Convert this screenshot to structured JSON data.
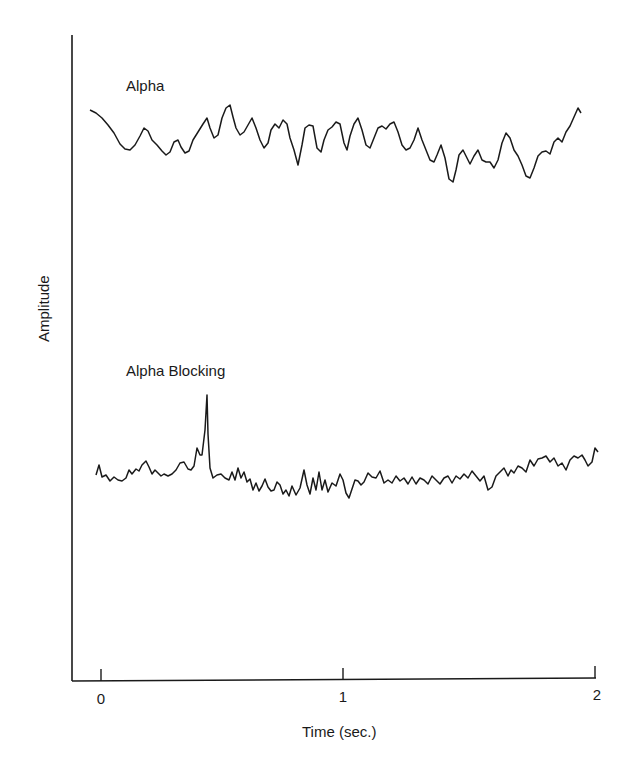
{
  "chart_data": {
    "type": "line",
    "title": "",
    "xlabel": "Time (sec.)",
    "ylabel": "Amplitude",
    "xlim": [
      -0.12,
      2.0
    ],
    "x_ticks": [
      0,
      1,
      2
    ],
    "x_tick_labels": [
      "0",
      "1",
      "2"
    ],
    "grid": false,
    "legend": "none (inline trace labels)",
    "series": [
      {
        "name": "Alpha",
        "description": "Regular rhythmic ~10 Hz alpha oscillation, moderate amplitude",
        "points_px": [
          [
            90,
            110
          ],
          [
            96,
            113
          ],
          [
            102,
            118
          ],
          [
            108,
            125
          ],
          [
            114,
            133
          ],
          [
            120,
            144
          ],
          [
            125,
            149
          ],
          [
            130,
            150
          ],
          [
            135,
            145
          ],
          [
            140,
            136
          ],
          [
            144,
            128
          ],
          [
            148,
            131
          ],
          [
            152,
            140
          ],
          [
            157,
            145
          ],
          [
            162,
            151
          ],
          [
            166,
            155
          ],
          [
            170,
            152
          ],
          [
            174,
            142
          ],
          [
            178,
            140
          ],
          [
            181,
            147
          ],
          [
            185,
            153
          ],
          [
            189,
            151
          ],
          [
            193,
            140
          ],
          [
            198,
            132
          ],
          [
            203,
            124
          ],
          [
            207,
            118
          ],
          [
            210,
            128
          ],
          [
            214,
            138
          ],
          [
            218,
            135
          ],
          [
            222,
            118
          ],
          [
            226,
            108
          ],
          [
            230,
            105
          ],
          [
            233,
            117
          ],
          [
            236,
            128
          ],
          [
            240,
            135
          ],
          [
            244,
            132
          ],
          [
            248,
            125
          ],
          [
            252,
            118
          ],
          [
            256,
            128
          ],
          [
            260,
            140
          ],
          [
            264,
            148
          ],
          [
            268,
            143
          ],
          [
            271,
            130
          ],
          [
            275,
            124
          ],
          [
            279,
            128
          ],
          [
            283,
            120
          ],
          [
            287,
            124
          ],
          [
            290,
            138
          ],
          [
            294,
            150
          ],
          [
            298,
            165
          ],
          [
            302,
            145
          ],
          [
            305,
            128
          ],
          [
            309,
            125
          ],
          [
            313,
            126
          ],
          [
            317,
            148
          ],
          [
            321,
            152
          ],
          [
            324,
            140
          ],
          [
            328,
            130
          ],
          [
            332,
            127
          ],
          [
            336,
            122
          ],
          [
            340,
            124
          ],
          [
            344,
            143
          ],
          [
            347,
            150
          ],
          [
            350,
            136
          ],
          [
            354,
            124
          ],
          [
            358,
            118
          ],
          [
            362,
            130
          ],
          [
            366,
            145
          ],
          [
            370,
            148
          ],
          [
            374,
            138
          ],
          [
            378,
            128
          ],
          [
            382,
            126
          ],
          [
            386,
            129
          ],
          [
            390,
            124
          ],
          [
            394,
            122
          ],
          [
            398,
            132
          ],
          [
            402,
            145
          ],
          [
            406,
            150
          ],
          [
            410,
            148
          ],
          [
            414,
            140
          ],
          [
            418,
            128
          ],
          [
            422,
            140
          ],
          [
            426,
            150
          ],
          [
            430,
            160
          ],
          [
            434,
            162
          ],
          [
            437,
            155
          ],
          [
            441,
            145
          ],
          [
            445,
            158
          ],
          [
            449,
            179
          ],
          [
            453,
            182
          ],
          [
            456,
            170
          ],
          [
            459,
            155
          ],
          [
            463,
            150
          ],
          [
            467,
            158
          ],
          [
            470,
            164
          ],
          [
            474,
            156
          ],
          [
            478,
            150
          ],
          [
            482,
            160
          ],
          [
            486,
            162
          ],
          [
            490,
            162
          ],
          [
            494,
            168
          ],
          [
            498,
            160
          ],
          [
            502,
            143
          ],
          [
            506,
            133
          ],
          [
            510,
            138
          ],
          [
            514,
            150
          ],
          [
            518,
            156
          ],
          [
            522,
            165
          ],
          [
            526,
            176
          ],
          [
            530,
            178
          ],
          [
            534,
            168
          ],
          [
            538,
            156
          ],
          [
            542,
            152
          ],
          [
            546,
            151
          ],
          [
            550,
            154
          ],
          [
            554,
            142
          ],
          [
            558,
            138
          ],
          [
            562,
            142
          ],
          [
            566,
            132
          ],
          [
            570,
            126
          ],
          [
            574,
            117
          ],
          [
            578,
            108
          ],
          [
            581,
            113
          ]
        ]
      },
      {
        "name": "Alpha Blocking",
        "description": "Low-amplitude desynchronized activity with a transient spike near t≈0.4 s",
        "points_px": [
          [
            96,
            475
          ],
          [
            99,
            465
          ],
          [
            102,
            477
          ],
          [
            106,
            475
          ],
          [
            110,
            481
          ],
          [
            114,
            477
          ],
          [
            118,
            480
          ],
          [
            122,
            481
          ],
          [
            126,
            478
          ],
          [
            129,
            470
          ],
          [
            132,
            474
          ],
          [
            136,
            469
          ],
          [
            139,
            471
          ],
          [
            142,
            465
          ],
          [
            146,
            461
          ],
          [
            149,
            467
          ],
          [
            152,
            474
          ],
          [
            155,
            470
          ],
          [
            158,
            473
          ],
          [
            161,
            476
          ],
          [
            164,
            474
          ],
          [
            168,
            476
          ],
          [
            172,
            474
          ],
          [
            176,
            470
          ],
          [
            180,
            463
          ],
          [
            184,
            462
          ],
          [
            188,
            469
          ],
          [
            191,
            470
          ],
          [
            194,
            466
          ],
          [
            197,
            448
          ],
          [
            200,
            455
          ],
          [
            202,
            455
          ],
          [
            205,
            430
          ],
          [
            207,
            395
          ],
          [
            208,
            434
          ],
          [
            210,
            468
          ],
          [
            213,
            478
          ],
          [
            217,
            475
          ],
          [
            221,
            474
          ],
          [
            225,
            478
          ],
          [
            229,
            480
          ],
          [
            232,
            472
          ],
          [
            235,
            480
          ],
          [
            238,
            468
          ],
          [
            241,
            478
          ],
          [
            244,
            472
          ],
          [
            247,
            482
          ],
          [
            250,
            479
          ],
          [
            253,
            490
          ],
          [
            256,
            483
          ],
          [
            259,
            491
          ],
          [
            262,
            486
          ],
          [
            265,
            479
          ],
          [
            268,
            487
          ],
          [
            271,
            491
          ],
          [
            274,
            490
          ],
          [
            277,
            482
          ],
          [
            280,
            485
          ],
          [
            283,
            494
          ],
          [
            286,
            490
          ],
          [
            289,
            496
          ],
          [
            292,
            486
          ],
          [
            296,
            495
          ],
          [
            300,
            488
          ],
          [
            304,
            470
          ],
          [
            307,
            485
          ],
          [
            310,
            494
          ],
          [
            313,
            478
          ],
          [
            316,
            490
          ],
          [
            319,
            472
          ],
          [
            322,
            490
          ],
          [
            325,
            480
          ],
          [
            328,
            492
          ],
          [
            332,
            483
          ],
          [
            336,
            486
          ],
          [
            340,
            474
          ],
          [
            343,
            480
          ],
          [
            346,
            493
          ],
          [
            349,
            498
          ],
          [
            352,
            489
          ],
          [
            355,
            480
          ],
          [
            358,
            481
          ],
          [
            361,
            485
          ],
          [
            364,
            482
          ],
          [
            368,
            473
          ],
          [
            372,
            477
          ],
          [
            376,
            478
          ],
          [
            380,
            471
          ],
          [
            384,
            483
          ],
          [
            388,
            480
          ],
          [
            392,
            483
          ],
          [
            396,
            476
          ],
          [
            400,
            481
          ],
          [
            404,
            478
          ],
          [
            408,
            484
          ],
          [
            412,
            477
          ],
          [
            416,
            484
          ],
          [
            420,
            478
          ],
          [
            424,
            480
          ],
          [
            428,
            484
          ],
          [
            432,
            476
          ],
          [
            436,
            480
          ],
          [
            440,
            484
          ],
          [
            444,
            478
          ],
          [
            448,
            476
          ],
          [
            452,
            483
          ],
          [
            456,
            476
          ],
          [
            460,
            479
          ],
          [
            464,
            474
          ],
          [
            468,
            478
          ],
          [
            472,
            471
          ],
          [
            476,
            476
          ],
          [
            480,
            481
          ],
          [
            484,
            476
          ],
          [
            488,
            490
          ],
          [
            492,
            487
          ],
          [
            496,
            476
          ],
          [
            500,
            472
          ],
          [
            504,
            468
          ],
          [
            508,
            476
          ],
          [
            511,
            470
          ],
          [
            514,
            473
          ],
          [
            518,
            466
          ],
          [
            522,
            468
          ],
          [
            526,
            472
          ],
          [
            530,
            460
          ],
          [
            534,
            466
          ],
          [
            538,
            459
          ],
          [
            542,
            458
          ],
          [
            546,
            456
          ],
          [
            550,
            462
          ],
          [
            554,
            458
          ],
          [
            558,
            466
          ],
          [
            562,
            463
          ],
          [
            566,
            470
          ],
          [
            570,
            460
          ],
          [
            574,
            456
          ],
          [
            578,
            458
          ],
          [
            582,
            455
          ],
          [
            585,
            460
          ],
          [
            588,
            466
          ],
          [
            592,
            462
          ],
          [
            595,
            448
          ],
          [
            598,
            452
          ]
        ]
      }
    ],
    "annotations": [
      "Alpha",
      "Alpha Blocking"
    ]
  },
  "labels": {
    "alpha": "Alpha",
    "alpha_blocking": "Alpha Blocking",
    "xlabel": "Time (sec.)",
    "ylabel": "Amplitude",
    "tick0": "0",
    "tick1": "1",
    "tick2": "2"
  },
  "colors": {
    "ink": "#1a1a1a",
    "background": "#ffffff"
  }
}
